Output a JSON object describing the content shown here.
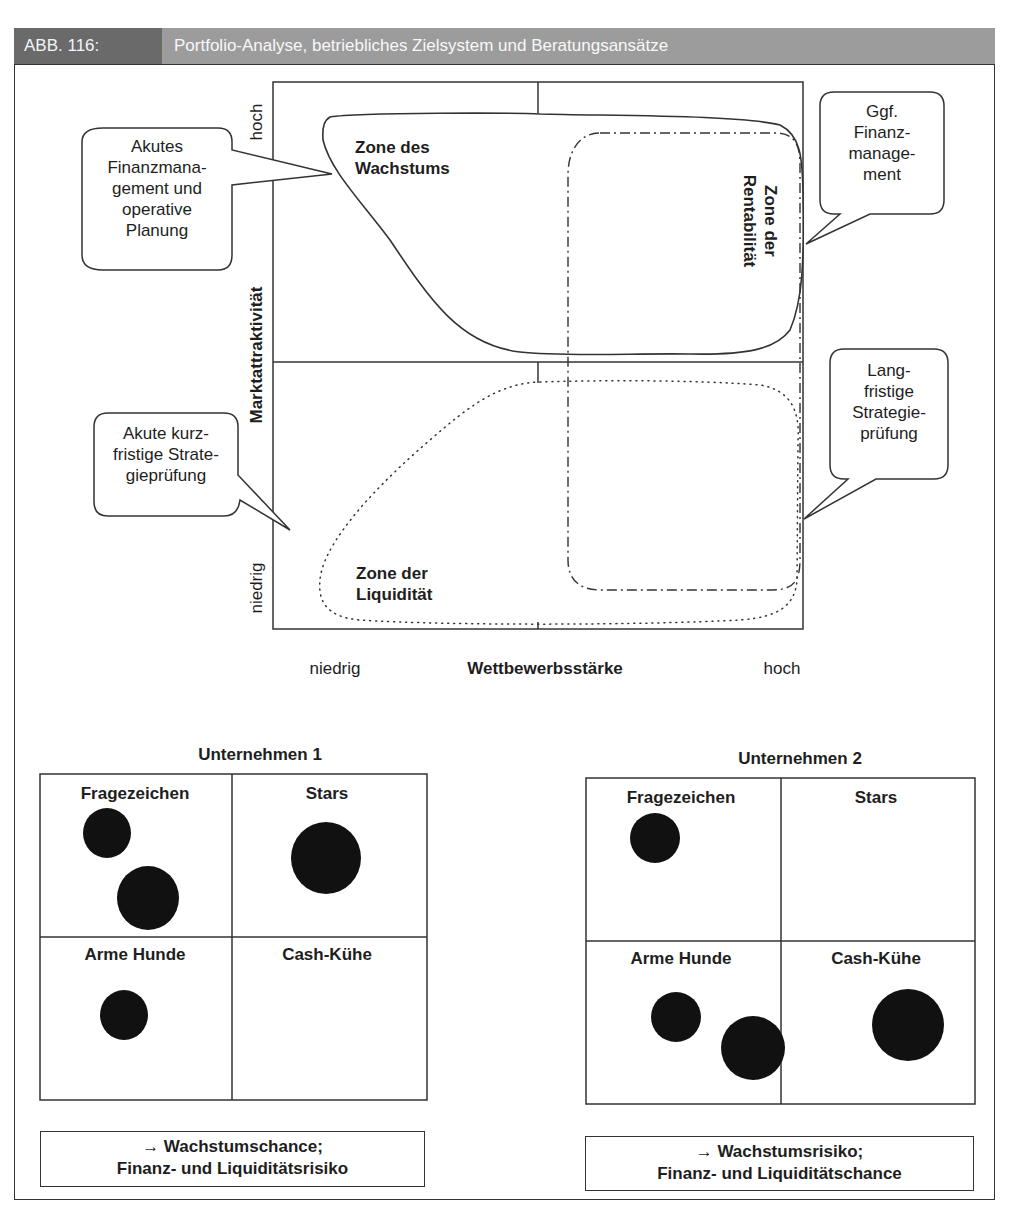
{
  "header": {
    "figure_number": "ABB. 116:",
    "title": "Portfolio-Analyse, betriebliches Zielsystem und Beratungsansätze"
  },
  "colors": {
    "header_number_bg": "#6a6a6a",
    "header_title_bg": "#9c9c9c",
    "line": "#333333",
    "bubble_fill": "#1a1a1a"
  },
  "matrix": {
    "y_axis_label": "Marktattraktivität",
    "y_high": "hoch",
    "y_low": "niedrig",
    "x_axis_label": "Wettbewerbsstärke",
    "x_low": "niedrig",
    "x_high": "hoch",
    "zones": {
      "growth": "Zone des\nWachstums",
      "profitability": "Zone der\nRentabilität",
      "liquidity": "Zone der\nLiquidität"
    },
    "callouts": {
      "top_left": "Akutes\nFinanzmana-\ngement und\noperative\nPlanung",
      "top_right": "Ggf.\nFinanz-\nmanage-\nment",
      "bottom_left": "Akute kurz-\nfristige Strate-\ngieprüfung",
      "bottom_right": "Lang-\nfristige\nStrategie-\nprüfung"
    }
  },
  "companies": [
    {
      "title": "Unternehmen 1",
      "quadrants": [
        "Fragezeichen",
        "Stars",
        "Arme Hunde",
        "Cash-Kühe"
      ],
      "summary_line1": "→ Wachstumschance;",
      "summary_line2": "Finanz- und Liquiditätsrisiko"
    },
    {
      "title": "Unternehmen 2",
      "quadrants": [
        "Fragezeichen",
        "Stars",
        "Arme Hunde",
        "Cash-Kühe"
      ],
      "summary_line1": "→ Wachstumsrisiko;",
      "summary_line2": "Finanz- und Liquiditätschance"
    }
  ]
}
